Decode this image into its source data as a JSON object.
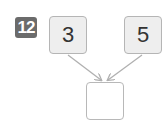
{
  "problem": {
    "number": "12"
  },
  "diagram": {
    "inputs": [
      {
        "value": "3"
      },
      {
        "value": "5"
      }
    ],
    "output": {
      "value": ""
    },
    "colors": {
      "badge_bg": "#6b6b6b",
      "box_fill": "#eeeeee",
      "box_border": "#b5b5b5",
      "arrow": "#b0b0b0"
    }
  }
}
